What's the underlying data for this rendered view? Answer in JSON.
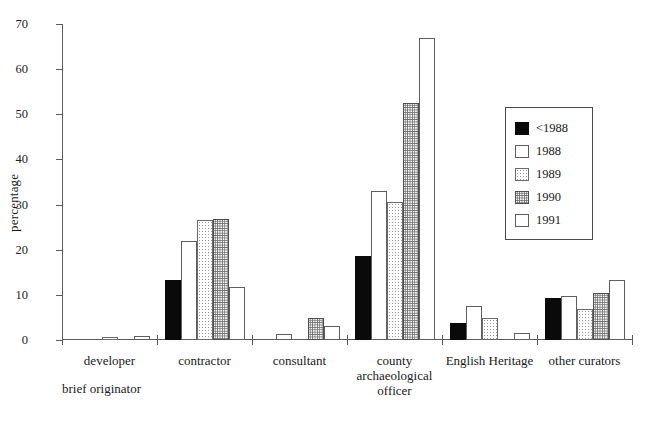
{
  "chart_data": {
    "type": "bar",
    "title": "",
    "xlabel": "brief originator",
    "ylabel": "percentage",
    "ylim": [
      0,
      70
    ],
    "yticks": [
      0,
      10,
      20,
      30,
      40,
      50,
      60,
      70
    ],
    "grid": false,
    "legend_position": "right-inside",
    "categories": [
      "developer",
      "contractor",
      "consultant",
      "county archaeological officer",
      "English Heritage",
      "other curators"
    ],
    "category_lines": [
      [
        "developer"
      ],
      [
        "contractor"
      ],
      [
        "consultant"
      ],
      [
        "county",
        "archaeological",
        "officer"
      ],
      [
        "English Heritage"
      ],
      [
        "other curators"
      ]
    ],
    "series": [
      {
        "name": "<1988",
        "values": [
          0,
          13.2,
          0,
          18.7,
          3.8,
          9.2
        ]
      },
      {
        "name": "1988",
        "values": [
          0,
          22.0,
          1.4,
          33.0,
          7.5,
          9.7
        ]
      },
      {
        "name": "1989",
        "values": [
          0.7,
          26.5,
          0,
          30.5,
          4.8,
          6.8
        ]
      },
      {
        "name": "1990",
        "values": [
          0,
          26.8,
          4.8,
          52.5,
          0,
          10.5
        ]
      },
      {
        "name": "1991",
        "values": [
          0.8,
          11.8,
          3.2,
          67.0,
          1.5,
          13.3
        ]
      }
    ]
  },
  "legend": {
    "entries": [
      {
        "label": "<1988"
      },
      {
        "label": "1988"
      },
      {
        "label": "1989"
      },
      {
        "label": "1990"
      },
      {
        "label": "1991"
      }
    ]
  }
}
